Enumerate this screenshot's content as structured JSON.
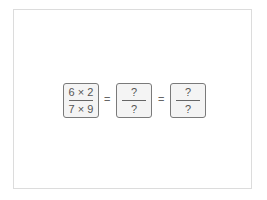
{
  "expression": {
    "fractions": [
      {
        "numerator": "6 × 2",
        "denominator": "7 × 9"
      },
      {
        "numerator": "?",
        "denominator": "?"
      },
      {
        "numerator": "?",
        "denominator": "?"
      }
    ],
    "operators": [
      "=",
      "="
    ]
  }
}
